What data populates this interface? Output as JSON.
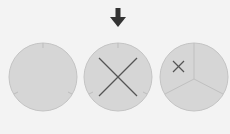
{
  "diagram": {
    "background": "#f3f3f3",
    "circle_fill": "#d6d6d6",
    "circle_stroke": "#c4c4c4",
    "mark_color": "#555555",
    "arrow_color": "#333333",
    "circles": [
      {
        "id": "circle-empty",
        "cx": 43,
        "cy": 77,
        "r": 34,
        "marks": "none"
      },
      {
        "id": "circle-full-x",
        "cx": 118,
        "cy": 77,
        "r": 34,
        "marks": "big-x",
        "selected": true
      },
      {
        "id": "circle-sector-x",
        "cx": 194,
        "cy": 77,
        "r": 34,
        "marks": "sectors-small-x"
      }
    ]
  }
}
